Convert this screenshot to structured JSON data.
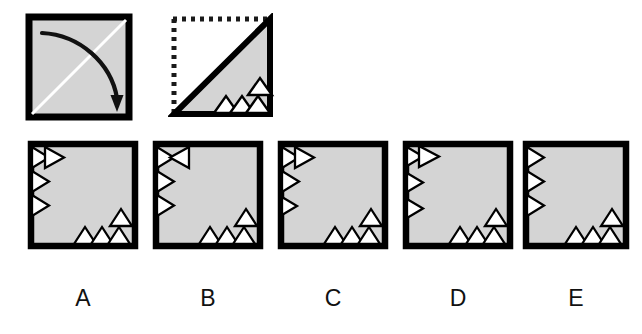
{
  "puzzle": {
    "type": "paper-folding-punch",
    "title": "",
    "colors": {
      "paper_fill": "#d4d4d4",
      "stroke": "#000000",
      "hole_fill": "#ffffff",
      "fold_line": "#ffffff",
      "dotted": "#1a1a1a",
      "label_text": "#111111",
      "background": "#ffffff"
    },
    "prompt": {
      "step1": {
        "name": "fold-step",
        "description": "square-with-diagonal-fold-arrow",
        "fold_line": "bottom-left-to-top-right-diagonal",
        "arrow": "curved-arrow-top-left-to-bottom-right",
        "filled": true
      },
      "step2": {
        "name": "punch-step",
        "description": "folded-triangle-lower-right-with-dotted-outline",
        "dotted_edges": "top-and-left",
        "solid_edges": "bottom-right-and-diagonal",
        "notches_bottom": 3,
        "notches_stacked_right": 1
      }
    },
    "options": [
      {
        "label": "A",
        "name": "option-a",
        "left_edge_triangles": 3,
        "left_extra_triangle": "right-of-top-triangle",
        "bottom_triangles": 3,
        "bottom_stacked_triangle": 1
      },
      {
        "label": "B",
        "name": "option-b",
        "left_edge_triangles": 3,
        "left_extra_triangle": "bowtie-x-at-top",
        "bottom_triangles": 3,
        "bottom_stacked_triangle": 1
      },
      {
        "label": "C",
        "name": "option-c",
        "left_edge_triangles": 3,
        "left_extra_triangle": "right-of-top-triangle",
        "bottom_triangles": 3,
        "bottom_stacked_triangle": 1
      },
      {
        "label": "D",
        "name": "option-d",
        "left_edge_triangles": 3,
        "left_extra_triangle": "right-of-top-triangle-spaced",
        "bottom_triangles": 3,
        "bottom_stacked_triangle": 1
      },
      {
        "label": "E",
        "name": "option-e",
        "left_edge_triangles": 3,
        "left_extra_triangle": "none",
        "bottom_triangles": 3,
        "bottom_stacked_triangle": 1
      }
    ]
  }
}
